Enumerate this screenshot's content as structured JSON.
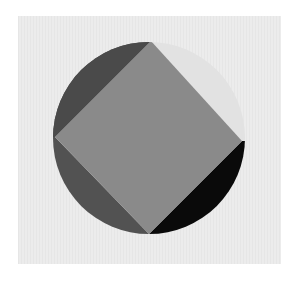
{
  "artwork": {
    "background_color": "#e8e8e8",
    "panel": {
      "x": 18,
      "y": 16,
      "width": 263,
      "height": 248
    },
    "circle": {
      "cx": 149,
      "cy": 138,
      "r": 96
    },
    "square_vertices": {
      "top": [
        151,
        41
      ],
      "right": [
        242,
        141
      ],
      "bottom": [
        149,
        234
      ],
      "left": [
        55,
        137
      ]
    },
    "colors": {
      "square": "#8a8a8a",
      "top_left_segment": "#4a4a4a",
      "top_right_segment": "#e2e2e2",
      "bottom_left_segment": "#525252",
      "bottom_right_segment": "#0a0a0a"
    }
  }
}
